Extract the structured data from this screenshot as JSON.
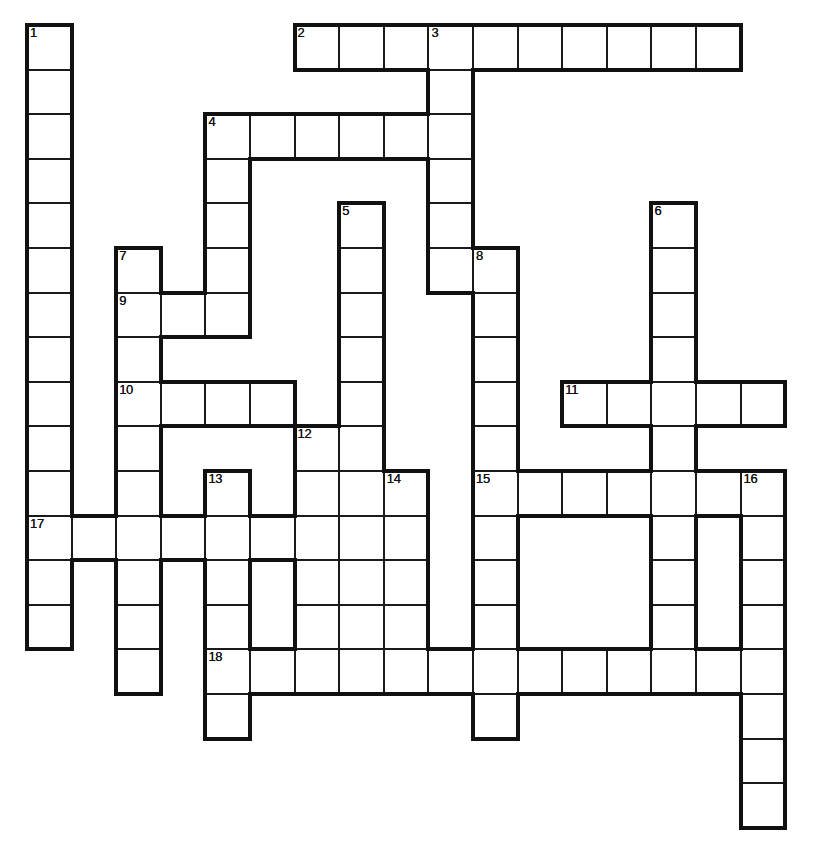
{
  "puzzle": {
    "kind": "crossword-grid",
    "title": "",
    "cell_size": 44.6,
    "origin": {
      "x": 27,
      "y": 25
    },
    "columns": 18,
    "rows": 19,
    "ink_color": "#111111",
    "cell_fill": "#ffffff",
    "background": "#ffffff",
    "numbers": [
      {
        "label": "1",
        "col": 0,
        "row": 0
      },
      {
        "label": "2",
        "col": 6,
        "row": 0
      },
      {
        "label": "3",
        "col": 9,
        "row": 0
      },
      {
        "label": "4",
        "col": 4,
        "row": 2
      },
      {
        "label": "5",
        "col": 7,
        "row": 4
      },
      {
        "label": "6",
        "col": 14,
        "row": 4
      },
      {
        "label": "7",
        "col": 2,
        "row": 5
      },
      {
        "label": "8",
        "col": 10,
        "row": 5
      },
      {
        "label": "9",
        "col": 2,
        "row": 6
      },
      {
        "label": "10",
        "col": 2,
        "row": 8
      },
      {
        "label": "11",
        "col": 12,
        "row": 8
      },
      {
        "label": "12",
        "col": 6,
        "row": 9
      },
      {
        "label": "13",
        "col": 4,
        "row": 10
      },
      {
        "label": "14",
        "col": 8,
        "row": 10
      },
      {
        "label": "15",
        "col": 10,
        "row": 10
      },
      {
        "label": "16",
        "col": 16,
        "row": 10
      },
      {
        "label": "17",
        "col": 0,
        "row": 11
      },
      {
        "label": "18",
        "col": 4,
        "row": 14
      }
    ],
    "entries": [
      {
        "number": "1",
        "direction": "down",
        "col": 0,
        "row": 0,
        "length": 14
      },
      {
        "number": "2",
        "direction": "across",
        "col": 6,
        "row": 0,
        "length": 10
      },
      {
        "number": "3",
        "direction": "down",
        "col": 9,
        "row": 0,
        "length": 6
      },
      {
        "number": "4",
        "direction": "across",
        "col": 4,
        "row": 2,
        "length": 6
      },
      {
        "number": "4",
        "direction": "down",
        "col": 4,
        "row": 2,
        "length": 5
      },
      {
        "number": "5",
        "direction": "down",
        "col": 7,
        "row": 4,
        "length": 11
      },
      {
        "number": "6",
        "direction": "down",
        "col": 14,
        "row": 4,
        "length": 5
      },
      {
        "number": "7",
        "direction": "down",
        "col": 2,
        "row": 5,
        "length": 10
      },
      {
        "number": "8",
        "direction": "down",
        "col": 10,
        "row": 5,
        "length": 12
      },
      {
        "number": "9",
        "direction": "across",
        "col": 2,
        "row": 6,
        "length": 3
      },
      {
        "number": "10",
        "direction": "across",
        "col": 2,
        "row": 8,
        "length": 4
      },
      {
        "number": "11",
        "direction": "across",
        "col": 12,
        "row": 8,
        "length": 5
      },
      {
        "number": "12",
        "direction": "down",
        "col": 6,
        "row": 9,
        "length": 6
      },
      {
        "number": "13",
        "direction": "down",
        "col": 4,
        "row": 10,
        "length": 7
      },
      {
        "number": "14",
        "direction": "down",
        "col": 8,
        "row": 10,
        "length": 5
      },
      {
        "number": "15",
        "direction": "across",
        "col": 10,
        "row": 10,
        "length": 7
      },
      {
        "number": "15",
        "direction": "down",
        "col": 10,
        "row": 10,
        "length": 7
      },
      {
        "number": "16",
        "direction": "down",
        "col": 16,
        "row": 10,
        "length": 8
      },
      {
        "number": "17",
        "direction": "across",
        "col": 0,
        "row": 11,
        "length": 7
      },
      {
        "number": "18",
        "direction": "across",
        "col": 4,
        "row": 14,
        "length": 12
      }
    ],
    "cells": [
      [
        0,
        0
      ],
      [
        0,
        1
      ],
      [
        0,
        2
      ],
      [
        0,
        3
      ],
      [
        0,
        4
      ],
      [
        0,
        5
      ],
      [
        0,
        6
      ],
      [
        0,
        7
      ],
      [
        0,
        8
      ],
      [
        0,
        9
      ],
      [
        0,
        10
      ],
      [
        0,
        11
      ],
      [
        0,
        12
      ],
      [
        0,
        13
      ],
      [
        6,
        0
      ],
      [
        7,
        0
      ],
      [
        8,
        0
      ],
      [
        9,
        0
      ],
      [
        10,
        0
      ],
      [
        11,
        0
      ],
      [
        12,
        0
      ],
      [
        13,
        0
      ],
      [
        14,
        0
      ],
      [
        15,
        0
      ],
      [
        9,
        1
      ],
      [
        4,
        2
      ],
      [
        5,
        2
      ],
      [
        6,
        2
      ],
      [
        7,
        2
      ],
      [
        8,
        2
      ],
      [
        9,
        2
      ],
      [
        4,
        3
      ],
      [
        9,
        3
      ],
      [
        4,
        4
      ],
      [
        7,
        4
      ],
      [
        9,
        4
      ],
      [
        14,
        4
      ],
      [
        2,
        5
      ],
      [
        4,
        5
      ],
      [
        7,
        5
      ],
      [
        9,
        5
      ],
      [
        10,
        5
      ],
      [
        14,
        5
      ],
      [
        2,
        6
      ],
      [
        3,
        6
      ],
      [
        4,
        6
      ],
      [
        7,
        6
      ],
      [
        10,
        6
      ],
      [
        14,
        6
      ],
      [
        2,
        7
      ],
      [
        7,
        7
      ],
      [
        10,
        7
      ],
      [
        14,
        7
      ],
      [
        2,
        8
      ],
      [
        3,
        8
      ],
      [
        4,
        8
      ],
      [
        5,
        8
      ],
      [
        7,
        8
      ],
      [
        10,
        8
      ],
      [
        12,
        8
      ],
      [
        13,
        8
      ],
      [
        14,
        8
      ],
      [
        15,
        8
      ],
      [
        16,
        8
      ],
      [
        2,
        9
      ],
      [
        6,
        9
      ],
      [
        7,
        9
      ],
      [
        10,
        9
      ],
      [
        14,
        9
      ],
      [
        2,
        10
      ],
      [
        4,
        10
      ],
      [
        6,
        10
      ],
      [
        7,
        10
      ],
      [
        8,
        10
      ],
      [
        10,
        10
      ],
      [
        11,
        10
      ],
      [
        12,
        10
      ],
      [
        13,
        10
      ],
      [
        14,
        10
      ],
      [
        15,
        10
      ],
      [
        16,
        10
      ],
      [
        0,
        11
      ],
      [
        1,
        11
      ],
      [
        2,
        11
      ],
      [
        3,
        11
      ],
      [
        4,
        11
      ],
      [
        5,
        11
      ],
      [
        6,
        11
      ],
      [
        7,
        11
      ],
      [
        8,
        11
      ],
      [
        10,
        11
      ],
      [
        14,
        11
      ],
      [
        16,
        11
      ],
      [
        0,
        12
      ],
      [
        2,
        12
      ],
      [
        4,
        12
      ],
      [
        6,
        12
      ],
      [
        7,
        12
      ],
      [
        8,
        12
      ],
      [
        10,
        12
      ],
      [
        14,
        12
      ],
      [
        16,
        12
      ],
      [
        0,
        13
      ],
      [
        2,
        13
      ],
      [
        4,
        13
      ],
      [
        6,
        13
      ],
      [
        7,
        13
      ],
      [
        8,
        13
      ],
      [
        10,
        13
      ],
      [
        14,
        13
      ],
      [
        16,
        13
      ],
      [
        2,
        14
      ],
      [
        4,
        14
      ],
      [
        5,
        14
      ],
      [
        6,
        14
      ],
      [
        7,
        14
      ],
      [
        8,
        14
      ],
      [
        9,
        14
      ],
      [
        10,
        14
      ],
      [
        11,
        14
      ],
      [
        12,
        14
      ],
      [
        13,
        14
      ],
      [
        14,
        14
      ],
      [
        15,
        14
      ],
      [
        16,
        14
      ],
      [
        4,
        15
      ],
      [
        10,
        15
      ],
      [
        16,
        15
      ],
      [
        16,
        16
      ],
      [
        16,
        17
      ]
    ]
  }
}
